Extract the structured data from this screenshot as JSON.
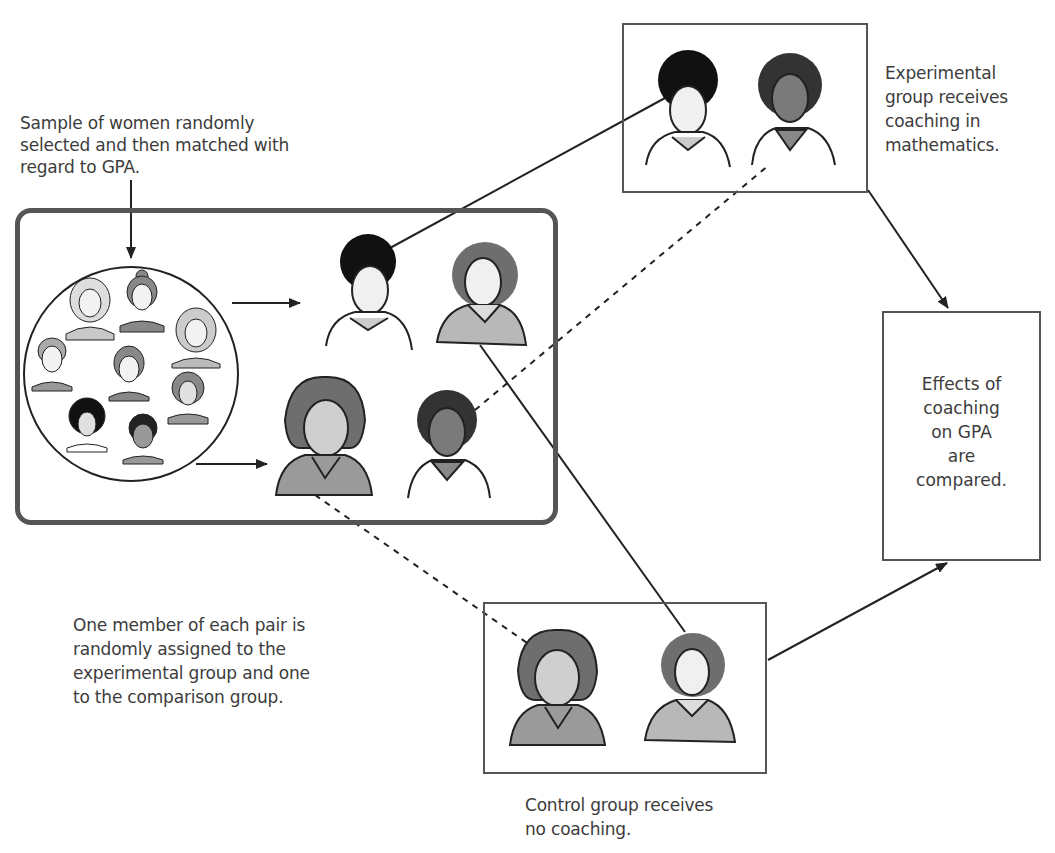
{
  "diagram": {
    "sample_label": [
      "Sample of women randomly",
      "selected and then matched with",
      "regard to GPA."
    ],
    "experimental_label": [
      "Experimental",
      "group receives",
      "coaching in",
      "mathematics."
    ],
    "outcome_label": [
      "Effects of",
      "coaching",
      "on GPA",
      "are",
      "compared."
    ],
    "assignment_label": [
      "One member of each pair is",
      "randomly assigned to the",
      "experimental group and one",
      "to the comparison group."
    ],
    "control_label": [
      "Control group receives",
      "no coaching."
    ],
    "colors": {
      "line": "#222222",
      "box_border": "#555555",
      "hair_dark": "#111111",
      "hair_medium": "#6e6e6e",
      "skin_light": "#e8e8e8",
      "skin_dark": "#7a7a7a",
      "shirt_gray": "#b8b8b8"
    },
    "nodes": [
      {
        "id": "sample-pool",
        "type": "circle",
        "members": 9
      },
      {
        "id": "pair-1",
        "members": [
          "dark-curly-hair-woman",
          "medium-wavy-hair-woman"
        ]
      },
      {
        "id": "pair-2",
        "members": [
          "bob-hair-woman",
          "dark-skin-curly-hair-woman"
        ]
      },
      {
        "id": "experimental-group",
        "members": [
          "dark-curly-hair-woman",
          "dark-skin-curly-hair-woman"
        ]
      },
      {
        "id": "control-group",
        "members": [
          "bob-hair-woman",
          "medium-wavy-hair-woman"
        ]
      },
      {
        "id": "outcome-box"
      }
    ]
  }
}
